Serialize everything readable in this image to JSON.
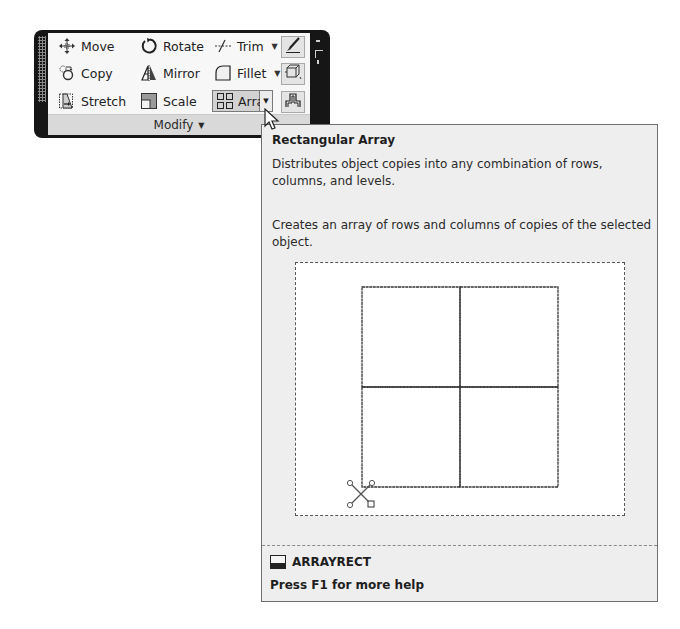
{
  "ribbon": {
    "panel_title": "Modify",
    "tools": [
      {
        "id": "move",
        "label": "Move",
        "icon": "move-icon"
      },
      {
        "id": "rotate",
        "label": "Rotate",
        "icon": "rotate-icon"
      },
      {
        "id": "trim",
        "label": "Trim",
        "icon": "trim-icon",
        "has_dropdown": true
      },
      {
        "id": "copy",
        "label": "Copy",
        "icon": "copy-icon"
      },
      {
        "id": "mirror",
        "label": "Mirror",
        "icon": "mirror-icon"
      },
      {
        "id": "fillet",
        "label": "Fillet",
        "icon": "fillet-icon",
        "has_dropdown": true
      },
      {
        "id": "stretch",
        "label": "Stretch",
        "icon": "stretch-icon"
      },
      {
        "id": "scale",
        "label": "Scale",
        "icon": "scale-icon"
      },
      {
        "id": "array",
        "label": "Array",
        "icon": "array-icon",
        "has_dropdown": true,
        "state": "hovered"
      }
    ],
    "side_buttons": [
      {
        "icon": "erase-brush-icon"
      },
      {
        "icon": "explode-icon"
      },
      {
        "icon": "offset-icon"
      }
    ],
    "dropdown_glyph": "▾"
  },
  "tooltip": {
    "title": "Rectangular Array",
    "description": "Distributes object copies into any combination of rows, columns, and levels.",
    "detail": "Creates an array of rows and columns of copies of the selected object.",
    "preview": {
      "rows": 2,
      "columns": 2
    },
    "command_name": "ARRAYRECT",
    "help_text": "Press F1 for more help"
  }
}
